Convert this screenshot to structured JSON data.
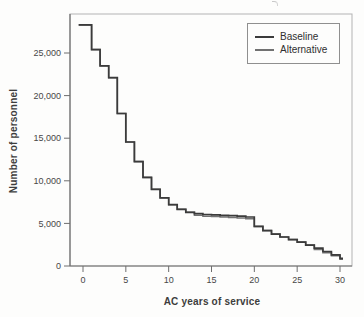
{
  "chart_data": {
    "type": "line",
    "subtype": "step",
    "title": "",
    "xlabel": "AC years of service",
    "ylabel": "Number of personnel",
    "xlim": [
      -1.5,
      31.4
    ],
    "ylim": [
      0,
      29600
    ],
    "grid": false,
    "legend_position": "top-right",
    "x_ticks": [
      0,
      5,
      10,
      15,
      20,
      25,
      30
    ],
    "x_tick_labels": [
      "0",
      "5",
      "10",
      "15",
      "20",
      "25",
      "30"
    ],
    "y_ticks": [
      0,
      5000,
      10000,
      15000,
      20000,
      25000
    ],
    "y_tick_labels": [
      "0",
      "5,000",
      "10,000",
      "15,000",
      "20,000",
      "25,000"
    ],
    "x": [
      0,
      1,
      2,
      3,
      4,
      5,
      6,
      7,
      8,
      9,
      10,
      11,
      12,
      13,
      14,
      15,
      16,
      17,
      18,
      19,
      20,
      21,
      22,
      23,
      24,
      25,
      26,
      27,
      28,
      29,
      30
    ],
    "series": [
      {
        "name": "Baseline",
        "color": "#3b3b3b",
        "stroke_width": 1.7,
        "values": [
          28300,
          25400,
          23500,
          22100,
          17900,
          14550,
          12250,
          10400,
          9000,
          8000,
          7200,
          6650,
          6300,
          6150,
          6050,
          6000,
          5950,
          5900,
          5850,
          5750,
          4650,
          4150,
          3750,
          3400,
          3100,
          2800,
          2450,
          2100,
          1700,
          1300,
          900
        ]
      },
      {
        "name": "Alternative",
        "color": "#717171",
        "stroke_width": 1.5,
        "values": [
          28300,
          25400,
          23500,
          22100,
          17900,
          14550,
          12250,
          10400,
          9000,
          8000,
          7200,
          6650,
          6300,
          5950,
          5850,
          5800,
          5750,
          5700,
          5650,
          5550,
          4650,
          4150,
          3750,
          3400,
          3100,
          2800,
          2450,
          1950,
          1550,
          1200,
          800
        ]
      }
    ],
    "axis_color": "#6e6e6e",
    "frame_color": "#b3b3b3",
    "tick_label_color": "#474747"
  }
}
